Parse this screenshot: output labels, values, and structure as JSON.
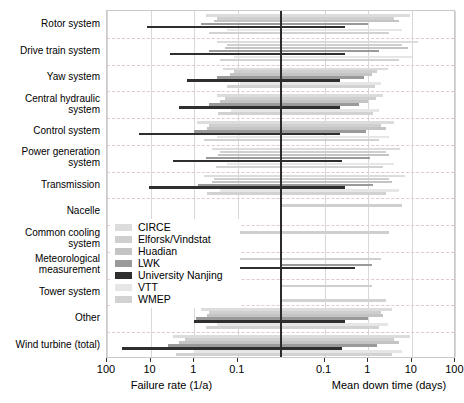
{
  "chart_data": {
    "type": "bar",
    "title": "",
    "orientation": "horizontal-dual-log",
    "left_axis": {
      "label": "Failure rate (1/a)",
      "ticks": [
        100,
        10,
        1,
        0.1
      ],
      "tick_labels": [
        "100",
        "10",
        "1",
        "0.1"
      ],
      "direction": "decreasing-left-to-right",
      "scale": "log"
    },
    "right_axis": {
      "label": "Mean down time (days)",
      "ticks": [
        0.1,
        1,
        10,
        100
      ],
      "tick_labels": [
        "0.1",
        "1",
        "10",
        "100"
      ],
      "direction": "increasing-left-to-right",
      "scale": "log"
    },
    "categories": [
      "Rotor system",
      "Drive train system",
      "Yaw system",
      "Central hydraulic\nsystem",
      "Control system",
      "Power generation\nsystem",
      "Transmission",
      "Nacelle",
      "Common cooling\nsystem",
      "Meteorological\nmeasurement",
      "Tower system",
      "Other",
      "Wind turbine (total)"
    ],
    "legend": {
      "position": "inside-left-middle",
      "entries": [
        {
          "name": "CIRCE",
          "color": "#dcdcdc"
        },
        {
          "name": "Elforsk/Vindstat",
          "color": "#cfcfcf"
        },
        {
          "name": "Huadian",
          "color": "#c4c4c4"
        },
        {
          "name": "LWK",
          "color": "#9a9a9a"
        },
        {
          "name": "University Nanjing",
          "color": "#2e2e2e"
        },
        {
          "name": "VTT",
          "color": "#e6e6e6"
        },
        {
          "name": "WMEP",
          "color": "#d2d2d2"
        }
      ]
    },
    "series": [
      {
        "name": "CIRCE",
        "color": "#dcdcdc",
        "bars": [
          {
            "category": "Rotor system",
            "failure_rate": 0.55,
            "down_time": 9.0
          },
          {
            "category": "Drive train system",
            "failure_rate": 0.3,
            "down_time": 14.0
          },
          {
            "category": "Yaw system",
            "failure_rate": 0.22,
            "down_time": 2.8
          },
          {
            "category": "Central hydraulic\nsystem",
            "failure_rate": 0.3,
            "down_time": 2.2
          },
          {
            "category": "Control system",
            "failure_rate": 0.85,
            "down_time": 4.0
          },
          {
            "category": "Power generation\nsystem",
            "failure_rate": 0.4,
            "down_time": 5.5
          },
          {
            "category": "Transmission",
            "failure_rate": 0.6,
            "down_time": 7.0
          },
          {
            "category": "Nacelle",
            "failure_rate": null,
            "down_time": null
          },
          {
            "category": "Common cooling\nsystem",
            "failure_rate": null,
            "down_time": null
          },
          {
            "category": "Meteorological\nmeasurement",
            "failure_rate": null,
            "down_time": null
          },
          {
            "category": "Tower system",
            "failure_rate": null,
            "down_time": null
          },
          {
            "category": "Other",
            "failure_rate": 0.7,
            "down_time": 3.5
          },
          {
            "category": "Wind turbine (total)",
            "failure_rate": 3.0,
            "down_time": 9.0
          }
        ]
      },
      {
        "name": "Elforsk/Vindstat",
        "color": "#cfcfcf",
        "bars": [
          {
            "category": "Rotor system",
            "failure_rate": 0.3,
            "down_time": 4.0
          },
          {
            "category": "Drive train system",
            "failure_rate": 0.18,
            "down_time": 6.0
          },
          {
            "category": "Yaw system",
            "failure_rate": 0.12,
            "down_time": 1.6
          },
          {
            "category": "Central hydraulic\nsystem",
            "failure_rate": 0.2,
            "down_time": 1.5
          },
          {
            "category": "Control system",
            "failure_rate": 0.45,
            "down_time": 2.0
          },
          {
            "category": "Power generation\nsystem",
            "failure_rate": 0.25,
            "down_time": 2.5
          },
          {
            "category": "Transmission",
            "failure_rate": 0.35,
            "down_time": 3.0
          },
          {
            "category": "Nacelle",
            "failure_rate": null,
            "down_time": 6.0
          },
          {
            "category": "Common cooling\nsystem",
            "failure_rate": 1.0,
            "down_time": 3.0
          },
          {
            "category": "Meteorological\nmeasurement",
            "failure_rate": 0.35,
            "down_time": 2.0
          },
          {
            "category": "Tower system",
            "failure_rate": null,
            "down_time": 1.2
          },
          {
            "category": "Other",
            "failure_rate": 0.45,
            "down_time": 2.0
          },
          {
            "category": "Wind turbine (total)",
            "failure_rate": 1.6,
            "down_time": 4.0
          }
        ]
      },
      {
        "name": "Huadian",
        "color": "#c4c4c4",
        "bars": [
          {
            "category": "Rotor system",
            "failure_rate": 0.35,
            "down_time": 5.0
          },
          {
            "category": "Drive train system",
            "failure_rate": 0.2,
            "down_time": 8.0
          },
          {
            "category": "Yaw system",
            "failure_rate": 0.15,
            "down_time": 1.2
          },
          {
            "category": "Central hydraulic\nsystem",
            "failure_rate": 0.25,
            "down_time": 1.0
          },
          {
            "category": "Control system",
            "failure_rate": 0.5,
            "down_time": 2.5
          },
          {
            "category": "Power generation\nsystem",
            "failure_rate": 0.28,
            "down_time": 3.0
          },
          {
            "category": "Transmission",
            "failure_rate": 0.4,
            "down_time": 3.5
          },
          {
            "category": "Nacelle",
            "failure_rate": null,
            "down_time": null
          },
          {
            "category": "Common cooling\nsystem",
            "failure_rate": null,
            "down_time": null
          },
          {
            "category": "Meteorological\nmeasurement",
            "failure_rate": null,
            "down_time": null
          },
          {
            "category": "Tower system",
            "failure_rate": null,
            "down_time": null
          },
          {
            "category": "Other",
            "failure_rate": 0.5,
            "down_time": 2.2
          },
          {
            "category": "Wind turbine (total)",
            "failure_rate": 2.2,
            "down_time": 5.0
          }
        ]
      },
      {
        "name": "LWK",
        "color": "#9a9a9a",
        "bars": [
          {
            "category": "Rotor system",
            "failure_rate": 0.7,
            "down_time": 1.0
          },
          {
            "category": "Drive train system",
            "failure_rate": 0.45,
            "down_time": 1.8
          },
          {
            "category": "Yaw system",
            "failure_rate": 0.3,
            "down_time": 0.8
          },
          {
            "category": "Central hydraulic\nsystem",
            "failure_rate": 0.45,
            "down_time": 0.6
          },
          {
            "category": "Control system",
            "failure_rate": 1.0,
            "down_time": 0.9
          },
          {
            "category": "Power generation\nsystem",
            "failure_rate": 0.55,
            "down_time": 1.1
          },
          {
            "category": "Transmission",
            "failure_rate": 0.8,
            "down_time": 1.3
          },
          {
            "category": "Nacelle",
            "failure_rate": null,
            "down_time": null
          },
          {
            "category": "Common cooling\nsystem",
            "failure_rate": null,
            "down_time": null
          },
          {
            "category": "Meteorological\nmeasurement",
            "failure_rate": null,
            "down_time": 1.2
          },
          {
            "category": "Tower system",
            "failure_rate": null,
            "down_time": null
          },
          {
            "category": "Other",
            "failure_rate": 0.9,
            "down_time": 1.0
          },
          {
            "category": "Wind turbine (total)",
            "failure_rate": 4.0,
            "down_time": 1.6
          }
        ]
      },
      {
        "name": "University Nanjing",
        "color": "#2e2e2e",
        "bars": [
          {
            "category": "Rotor system",
            "failure_rate": 12.0,
            "down_time": 0.3
          },
          {
            "category": "Drive train system",
            "failure_rate": 3.5,
            "down_time": 0.3
          },
          {
            "category": "Yaw system",
            "failure_rate": 1.5,
            "down_time": 0.22
          },
          {
            "category": "Central hydraulic\nsystem",
            "failure_rate": 2.2,
            "down_time": 0.22
          },
          {
            "category": "Control system",
            "failure_rate": 18.0,
            "down_time": 0.22
          },
          {
            "category": "Power generation\nsystem",
            "failure_rate": 3.0,
            "down_time": 0.25
          },
          {
            "category": "Transmission",
            "failure_rate": 11.0,
            "down_time": 0.3
          },
          {
            "category": "Nacelle",
            "failure_rate": null,
            "down_time": null
          },
          {
            "category": "Common cooling\nsystem",
            "failure_rate": null,
            "down_time": null
          },
          {
            "category": "Meteorological\nmeasurement",
            "failure_rate": 0.5,
            "down_time": 0.5
          },
          {
            "category": "Tower system",
            "failure_rate": null,
            "down_time": null
          },
          {
            "category": "Other",
            "failure_rate": 1.0,
            "down_time": 0.3
          },
          {
            "category": "Wind turbine (total)",
            "failure_rate": 45.0,
            "down_time": 0.25
          }
        ]
      },
      {
        "name": "VTT",
        "color": "#e6e6e6",
        "bars": [
          {
            "category": "Rotor system",
            "failure_rate": 0.18,
            "down_time": 6.0
          },
          {
            "category": "Drive train system",
            "failure_rate": 0.12,
            "down_time": 10.0
          },
          {
            "category": "Yaw system",
            "failure_rate": 0.09,
            "down_time": 2.0
          },
          {
            "category": "Central hydraulic\nsystem",
            "failure_rate": 0.14,
            "down_time": 1.8
          },
          {
            "category": "Control system",
            "failure_rate": 0.3,
            "down_time": 3.0
          },
          {
            "category": "Power generation\nsystem",
            "failure_rate": 0.18,
            "down_time": 4.0
          },
          {
            "category": "Transmission",
            "failure_rate": 0.25,
            "down_time": 5.0
          },
          {
            "category": "Nacelle",
            "failure_rate": null,
            "down_time": null
          },
          {
            "category": "Common cooling\nsystem",
            "failure_rate": null,
            "down_time": null
          },
          {
            "category": "Meteorological\nmeasurement",
            "failure_rate": null,
            "down_time": null
          },
          {
            "category": "Tower system",
            "failure_rate": null,
            "down_time": null
          },
          {
            "category": "Other",
            "failure_rate": 0.3,
            "down_time": 2.8
          },
          {
            "category": "Wind turbine (total)",
            "failure_rate": 1.0,
            "down_time": 6.0
          }
        ]
      },
      {
        "name": "WMEP",
        "color": "#d2d2d2",
        "bars": [
          {
            "category": "Rotor system",
            "failure_rate": 0.45,
            "down_time": 3.0
          },
          {
            "category": "Drive train system",
            "failure_rate": 0.25,
            "down_time": 5.0
          },
          {
            "category": "Yaw system",
            "failure_rate": 0.18,
            "down_time": 1.4
          },
          {
            "category": "Central hydraulic\nsystem",
            "failure_rate": 0.28,
            "down_time": 1.3
          },
          {
            "category": "Control system",
            "failure_rate": 0.6,
            "down_time": 1.8
          },
          {
            "category": "Power generation\nsystem",
            "failure_rate": 0.32,
            "down_time": 2.2
          },
          {
            "category": "Transmission",
            "failure_rate": 0.5,
            "down_time": 2.6
          },
          {
            "category": "Nacelle",
            "failure_rate": null,
            "down_time": null
          },
          {
            "category": "Common cooling\nsystem",
            "failure_rate": null,
            "down_time": null
          },
          {
            "category": "Meteorological\nmeasurement",
            "failure_rate": null,
            "down_time": null
          },
          {
            "category": "Tower system",
            "failure_rate": null,
            "down_time": 2.5
          },
          {
            "category": "Other",
            "failure_rate": 0.55,
            "down_time": 1.8
          },
          {
            "category": "Wind turbine (total)",
            "failure_rate": 2.6,
            "down_time": 3.5
          }
        ]
      }
    ]
  }
}
